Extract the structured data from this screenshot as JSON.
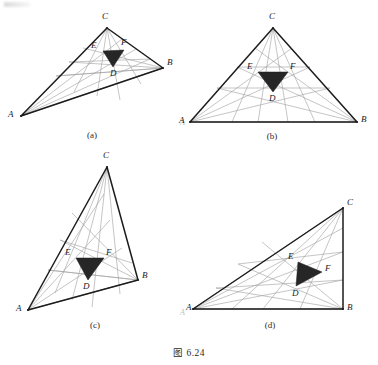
{
  "figure": {
    "caption": "图 6.24",
    "panels": [
      {
        "id": "a",
        "caption": "(a)",
        "vertices": {
          "A": "A",
          "B": "B",
          "C": "C"
        },
        "inner": {
          "D": "D",
          "E": "E",
          "F": "F"
        },
        "shape": "obtuse-scalene"
      },
      {
        "id": "b",
        "caption": "(b)",
        "vertices": {
          "A": "A",
          "B": "B",
          "C": "C"
        },
        "inner": {
          "D": "D",
          "E": "E",
          "F": "F"
        },
        "shape": "isosceles"
      },
      {
        "id": "c",
        "caption": "(c)",
        "vertices": {
          "A": "A",
          "B": "B",
          "C": "C"
        },
        "inner": {
          "D": "D",
          "E": "E",
          "F": "F"
        },
        "shape": "tall-scalene"
      },
      {
        "id": "d",
        "caption": "(d)",
        "vertices": {
          "A": "A",
          "B": "B",
          "C": "C"
        },
        "inner": {
          "D": "D",
          "E": "E",
          "F": "F"
        },
        "shape": "right-triangle"
      }
    ],
    "ghost_marks": [
      "A",
      "A"
    ],
    "colors": {
      "outline": "#1c1c1c",
      "cevian": "#9a9a9a",
      "inner_fill": "#262626",
      "label": "#1a1a1a",
      "background": "#ffffff"
    }
  },
  "geometry": {
    "a": {
      "A": [
        21,
        116
      ],
      "B": [
        163,
        68
      ],
      "C": [
        107,
        28
      ],
      "D": [
        113,
        66
      ],
      "E": [
        103,
        51
      ],
      "F": [
        124,
        50
      ],
      "label_A": [
        10,
        112
      ],
      "label_B": [
        167,
        60
      ],
      "label_C": [
        101,
        11
      ],
      "label_D": [
        109,
        69
      ],
      "label_E": [
        92,
        42
      ],
      "label_F": [
        120,
        38
      ]
    },
    "b": {
      "A": [
        190,
        122
      ],
      "B": [
        357,
        122
      ],
      "C": [
        273,
        28
      ],
      "D": [
        273,
        91
      ],
      "E": [
        258,
        72
      ],
      "F": [
        288,
        72
      ],
      "label_A": [
        181,
        119
      ],
      "label_B": [
        361,
        116
      ],
      "label_C": [
        269,
        11
      ],
      "label_D": [
        269,
        94
      ],
      "label_E": [
        248,
        63
      ],
      "label_F": [
        290,
        63
      ]
    },
    "c": {
      "A": [
        28,
        310
      ],
      "B": [
        138,
        280
      ],
      "C": [
        107,
        167
      ],
      "D": [
        86,
        279
      ],
      "E": [
        76,
        258
      ],
      "F": [
        104,
        258
      ],
      "label_A": [
        18,
        306
      ],
      "label_B": [
        142,
        272
      ],
      "label_C": [
        103,
        151
      ],
      "label_D": [
        82,
        282
      ],
      "label_E": [
        66,
        249
      ],
      "label_F": [
        106,
        249
      ]
    },
    "d": {
      "A": [
        193,
        309
      ],
      "B": [
        343,
        309
      ],
      "C": [
        343,
        208
      ],
      "D": [
        296,
        285
      ],
      "E": [
        298,
        262
      ],
      "F": [
        322,
        272
      ],
      "label_A": [
        186,
        306
      ],
      "label_B": [
        346,
        306
      ],
      "label_C": [
        346,
        199
      ],
      "label_D": [
        292,
        290
      ],
      "label_E": [
        290,
        254
      ],
      "label_F": [
        324,
        265
      ]
    }
  }
}
